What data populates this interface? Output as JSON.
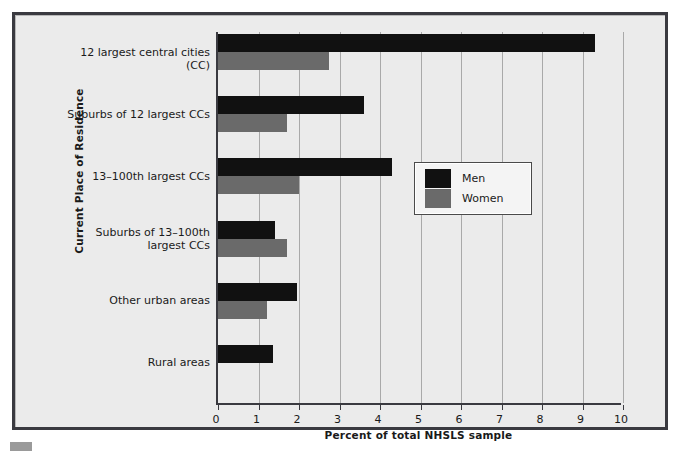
{
  "chart_data": {
    "type": "bar",
    "orientation": "horizontal",
    "title": "",
    "xlabel": "Percent of total NHSLS sample",
    "ylabel": "Current Place of Residence",
    "xlim": [
      0,
      10
    ],
    "xticks": [
      "0",
      "1",
      "2",
      "3",
      "4",
      "5",
      "6",
      "7",
      "8",
      "9",
      "10"
    ],
    "grid": true,
    "grid_axis": "x",
    "legend_position": "center-right",
    "categories": [
      "12 largest central cities (CC)",
      "Suburbs of 12 largest CCs",
      "13–100th largest CCs",
      "Suburbs of 13–100th\nlargest CCs",
      "Other urban areas",
      "Rural areas"
    ],
    "series": [
      {
        "name": "Men",
        "color": "#111111",
        "values": [
          9.3,
          3.6,
          4.3,
          1.4,
          1.95,
          1.35
        ]
      },
      {
        "name": "Women",
        "color": "#6a6a6a",
        "values": [
          2.75,
          1.7,
          2.0,
          1.7,
          1.2,
          0
        ]
      }
    ]
  },
  "legend": {
    "items": [
      {
        "label": "Men",
        "color": "#111111"
      },
      {
        "label": "Women",
        "color": "#6a6a6a"
      }
    ]
  },
  "colors": {
    "men": "#111111",
    "women": "#6a6a6a",
    "frame": "#3a3a40",
    "panel": "#ebebeb",
    "gridline": "#a9a9a9"
  }
}
